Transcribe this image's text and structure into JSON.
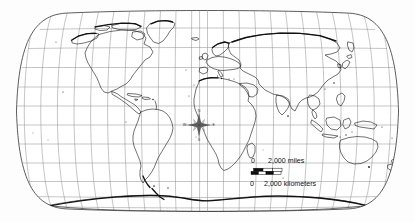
{
  "figure": {
    "name": "world-map-robinson-outline",
    "kind": "reference-map",
    "projection_label": "Robinson",
    "background_color": "#fdfdfd",
    "frame_color": "#4a4a4a",
    "graticule_color": "#8a8a8a",
    "coastline_color": "#1c1c1c"
  },
  "graticule": {
    "meridian_interval_degrees": 15,
    "parallel_interval_degrees": 15,
    "meridian_count": 25,
    "parallel_count": 11,
    "parallel_labels": [
      75,
      60,
      45,
      30,
      15,
      0,
      -15,
      -30,
      -45,
      -60,
      -75
    ],
    "central_meridian_degrees": 0,
    "grid_visible": "true"
  },
  "compass_rose": {
    "name": "compass-rose",
    "north_label": "N",
    "south_label": "S",
    "east_label": "E",
    "west_label": "W",
    "center_x": 199,
    "center_y": 125
  },
  "scale_bar": {
    "name": "scale-bar",
    "miles": {
      "zero_label": "0",
      "value_label": "2,000 miles"
    },
    "kilometers": {
      "zero_label": "0",
      "value_label": "2,000 kilometers"
    },
    "segment_fill": "#0d0d0d",
    "segment_outline": "#0d0d0d"
  },
  "landmasses": [
    {
      "name": "north-america",
      "label": "North America"
    },
    {
      "name": "south-america",
      "label": "South America"
    },
    {
      "name": "greenland",
      "label": "Greenland"
    },
    {
      "name": "europe",
      "label": "Europe"
    },
    {
      "name": "africa",
      "label": "Africa"
    },
    {
      "name": "asia",
      "label": "Asia"
    },
    {
      "name": "australia",
      "label": "Australia"
    },
    {
      "name": "antarctica",
      "label": "Antarctica"
    },
    {
      "name": "madagascar",
      "label": "Madagascar"
    },
    {
      "name": "new-zealand",
      "label": "New Zealand"
    },
    {
      "name": "japan",
      "label": "Japan"
    },
    {
      "name": "indonesia",
      "label": "Indonesia"
    },
    {
      "name": "british-isles",
      "label": "British Isles"
    }
  ]
}
